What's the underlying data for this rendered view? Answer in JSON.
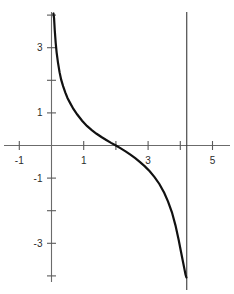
{
  "chart_data": {
    "type": "line",
    "title": "",
    "subtitle": "",
    "xlabel": "",
    "ylabel": "",
    "xlim": [
      -1.65,
      5.9
    ],
    "ylim": [
      -4.05,
      4.05
    ],
    "grid": false,
    "legend": null,
    "x_ticks": [
      -1,
      0,
      1,
      2,
      3,
      4,
      5
    ],
    "x_tick_labels": [
      "-1",
      "",
      "1",
      "",
      "3",
      "",
      "5"
    ],
    "y_ticks": [
      -4,
      -3,
      -2,
      -1,
      0,
      1,
      2,
      3,
      4
    ],
    "y_tick_labels": [
      "",
      "-3",
      "",
      "-1",
      "",
      "1",
      "",
      "3",
      ""
    ],
    "annotations": [
      {
        "name": "vertical-asymptote-left",
        "x": 0.0,
        "note": "curve rises to +infinity along y-axis"
      },
      {
        "name": "vertical-asymptote-right",
        "x": 4.2,
        "note": "curve falls to -infinity approaching x = 4.2"
      },
      {
        "name": "x-intercept",
        "x": 2.0,
        "y": 0.0
      }
    ],
    "series": [
      {
        "name": "curve",
        "color": "#111111",
        "x": [
          0.06,
          0.08,
          0.1,
          0.13,
          0.16,
          0.2,
          0.25,
          0.3,
          0.36,
          0.43,
          0.5,
          0.58,
          0.68,
          0.8,
          0.95,
          1.1,
          1.25,
          1.4,
          1.55,
          1.7,
          1.85,
          2.0,
          2.15,
          2.3,
          2.45,
          2.6,
          2.75,
          2.9,
          3.05,
          3.2,
          3.35,
          3.5,
          3.62,
          3.74,
          3.85,
          3.95,
          4.02,
          4.08,
          4.13,
          4.16,
          4.18,
          4.19
        ],
        "y": [
          4.05,
          3.9,
          3.55,
          3.15,
          2.85,
          2.55,
          2.25,
          2.02,
          1.82,
          1.62,
          1.45,
          1.3,
          1.12,
          0.95,
          0.76,
          0.6,
          0.47,
          0.36,
          0.26,
          0.17,
          0.08,
          0.0,
          -0.09,
          -0.18,
          -0.28,
          -0.39,
          -0.51,
          -0.64,
          -0.79,
          -0.97,
          -1.18,
          -1.45,
          -1.72,
          -2.05,
          -2.45,
          -2.9,
          -3.25,
          -3.55,
          -3.8,
          -3.95,
          -4.02,
          -4.05
        ]
      }
    ],
    "axis_color": "#6b6b6b",
    "label_color": "#2b2b2b",
    "asymptote_color": "#3a3a3a",
    "background_color": "#ffffff"
  }
}
